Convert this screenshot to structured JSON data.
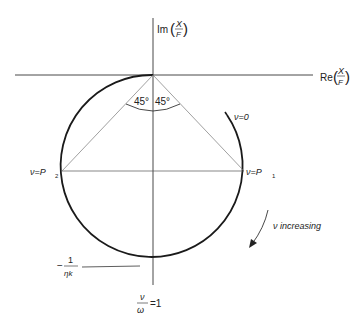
{
  "diagram": {
    "type": "nyquist-circle",
    "axes": {
      "imag_label_prefix": "Im",
      "real_label_prefix": "Re",
      "fraction_num": "X",
      "fraction_den": "F"
    },
    "angles": {
      "left": "45°",
      "right": "45°"
    },
    "points": {
      "nu_zero": "ν=0",
      "p1": "ν=P",
      "p1_sub": "1",
      "p2": "ν=P",
      "p2_sub": "2"
    },
    "annotations": {
      "direction": "ν increasing",
      "min_value_sign": "−",
      "min_value_num": "1",
      "min_value_den": "ηk",
      "resonance_num": "ν",
      "resonance_den": "ω",
      "resonance_rhs": "=1"
    },
    "colors": {
      "ink": "#222222",
      "thin_line": "#555555",
      "background": "#ffffff"
    }
  }
}
